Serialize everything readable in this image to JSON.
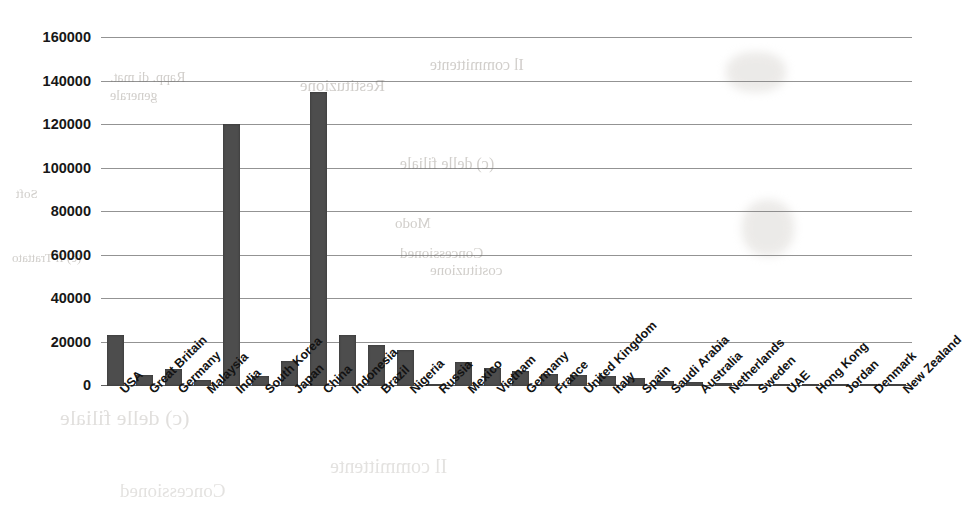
{
  "chart_data": {
    "type": "bar",
    "title": "",
    "subtitle": "",
    "xlabel": "",
    "ylabel": "",
    "ylim": [
      0,
      160000
    ],
    "y_ticks": [
      0,
      20000,
      40000,
      60000,
      80000,
      100000,
      120000,
      140000,
      160000
    ],
    "y_tick_labels": [
      "0",
      "20000",
      "40000",
      "60000",
      "80000",
      "100000",
      "120000",
      "140000",
      "160000"
    ],
    "grid": "horizontal",
    "legend": "none",
    "bar_color": "#4d4d4d",
    "categories": [
      "USA",
      "Great Britain",
      "Germany",
      "Malaysia",
      "India",
      "South Korea",
      "Japan",
      "China",
      "Indonesia",
      "Brazil",
      "Nigeria",
      "Russia",
      "Mexico",
      "Vietnam",
      "Germany",
      "France",
      "United Kingdom",
      "Italy",
      "Spain",
      "Saudi Arabia",
      "Australia",
      "Netherlands",
      "Sweden",
      "UAE",
      "Hong Kong",
      "Jordan",
      "Denmark",
      "New Zealand"
    ],
    "values": [
      23500,
      5200,
      8000,
      2600,
      120500,
      4500,
      11500,
      135000,
      23500,
      19000,
      16500,
      1000,
      11000,
      8200,
      6800,
      5600,
      5000,
      4800,
      3800,
      2400,
      1900,
      1200,
      800,
      700,
      600,
      500,
      450,
      350
    ]
  },
  "scan": {
    "bleed_lines": [
      "Il committente",
      "(e) Il Trattato",
      "(c) delle filiale",
      "Restituzione",
      "Concessioned",
      "Rapp. di mat.",
      "Modo",
      "costituzione",
      "generale",
      "Soft"
    ]
  }
}
